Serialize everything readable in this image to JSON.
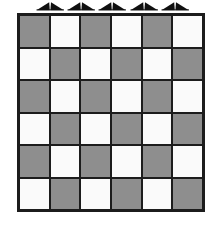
{
  "figure": {
    "type": "checkerboard-diagram",
    "background_color": "#ffffff"
  },
  "markers": {
    "name": "top-edge-arrow-markers",
    "count": 5,
    "shape": "double-wedge-arrow-pair",
    "color": "#101010",
    "direction": "up",
    "items": [
      {
        "label": "marker-1"
      },
      {
        "label": "marker-2"
      },
      {
        "label": "marker-3"
      },
      {
        "label": "marker-4"
      },
      {
        "label": "marker-5"
      }
    ]
  },
  "board": {
    "name": "checkerboard",
    "rows": 6,
    "columns": 6,
    "top_left_color": "dark",
    "colors": {
      "dark": "#8e8e8e",
      "light": "#fafafa",
      "grid_line": "#1c1c1c",
      "border": "#1c1c1c"
    },
    "grid": [
      [
        "dark",
        "light",
        "dark",
        "light",
        "dark",
        "light"
      ],
      [
        "light",
        "dark",
        "light",
        "dark",
        "light",
        "dark"
      ],
      [
        "dark",
        "light",
        "dark",
        "light",
        "dark",
        "light"
      ],
      [
        "light",
        "dark",
        "light",
        "dark",
        "light",
        "dark"
      ],
      [
        "dark",
        "light",
        "dark",
        "light",
        "dark",
        "light"
      ],
      [
        "light",
        "dark",
        "light",
        "dark",
        "light",
        "dark"
      ]
    ]
  }
}
